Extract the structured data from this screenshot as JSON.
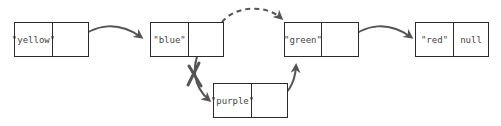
{
  "diagram": {
    "type": "linked-list-insertion",
    "colors": {
      "border": "#2a2a2a",
      "arrow": "#555555",
      "text": "#444444",
      "background": "#ffffff"
    },
    "nodes": [
      {
        "id": "yellow",
        "value": "\"yellow\"",
        "next": ""
      },
      {
        "id": "blue",
        "value": "\"blue\"",
        "next": ""
      },
      {
        "id": "green",
        "value": "\"green\"",
        "next": ""
      },
      {
        "id": "red",
        "value": "\"red\"",
        "next": "null"
      },
      {
        "id": "purple",
        "value": "\"purple\"",
        "next": ""
      }
    ],
    "edges": [
      {
        "from": "yellow",
        "to": "blue",
        "style": "solid"
      },
      {
        "from": "blue",
        "to": "green",
        "style": "dashed"
      },
      {
        "from": "blue",
        "to": "purple",
        "style": "solid",
        "crossed_out": true
      },
      {
        "from": "purple",
        "to": "green",
        "style": "solid"
      },
      {
        "from": "green",
        "to": "red",
        "style": "solid"
      }
    ]
  }
}
